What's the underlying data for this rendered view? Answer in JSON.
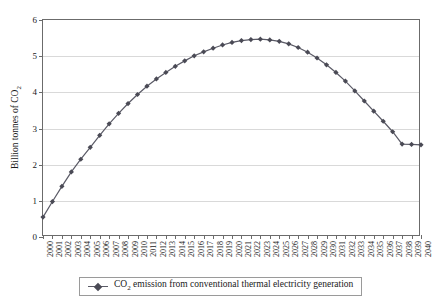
{
  "chart_data": {
    "type": "line",
    "title": "",
    "subtitle": "",
    "xlabel": "",
    "ylabel": "Billion tonnes of CO2",
    "ylabel_parts": {
      "before": "Billion tonnes of CO",
      "sub": "2"
    },
    "ylim": [
      0,
      6
    ],
    "ytick_values": [
      0,
      1,
      2,
      3,
      4,
      5,
      6
    ],
    "ytick_labels": [
      "0",
      "1",
      "2",
      "3",
      "4",
      "5",
      "6"
    ],
    "grid": "horizontal",
    "legend_position": "bottom",
    "marker": "diamond",
    "line_color": "#5a5a66",
    "marker_color": "#4a4a55",
    "grid_color": "#d9d9d9",
    "axis_color": "#6b6b6b",
    "categories": [
      "2000",
      "2001",
      "2002",
      "2003",
      "2004",
      "2005",
      "2006",
      "2007",
      "2008",
      "2009",
      "2010",
      "2011",
      "2012",
      "2013",
      "2014",
      "2015",
      "2016",
      "2017",
      "2018",
      "2019",
      "2020",
      "2021",
      "2022",
      "2023",
      "2024",
      "2025",
      "2026",
      "2027",
      "2028",
      "2029",
      "2030",
      "2031",
      "2032",
      "2033",
      "2034",
      "2035",
      "2036",
      "2037",
      "2038",
      "2039",
      "2040"
    ],
    "series": [
      {
        "name": "CO2 emission from conventional thermal electricity generation",
        "name_parts": {
          "before": "CO",
          "sub": "2",
          "after": " emission from conventional thermal electricity generation"
        },
        "values": [
          0.55,
          0.98,
          1.4,
          1.8,
          2.15,
          2.48,
          2.81,
          3.13,
          3.42,
          3.69,
          3.94,
          4.17,
          4.37,
          4.55,
          4.72,
          4.87,
          5.01,
          5.12,
          5.22,
          5.31,
          5.38,
          5.43,
          5.46,
          5.47,
          5.45,
          5.41,
          5.34,
          5.24,
          5.11,
          4.95,
          4.76,
          4.55,
          4.31,
          4.04,
          3.76,
          3.48,
          3.2,
          2.91,
          2.57,
          2.56,
          2.55
        ]
      }
    ]
  }
}
